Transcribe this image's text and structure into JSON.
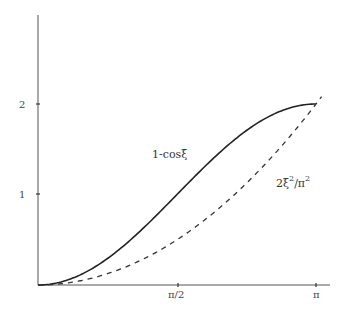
{
  "chart_data": {
    "type": "line",
    "title": "",
    "xlabel": "",
    "ylabel": "",
    "xlim": [
      0,
      3.14159
    ],
    "ylim": [
      0,
      2.3
    ],
    "grid": false,
    "legend": "none (inline curve labels)",
    "x_ticks": [
      {
        "value": 1.5708,
        "label": "π/2"
      },
      {
        "value": 3.14159,
        "label": "π"
      }
    ],
    "y_ticks": [
      {
        "value": 1,
        "label": "1"
      },
      {
        "value": 2,
        "label": "2"
      }
    ],
    "x": [
      0,
      0.3142,
      0.6283,
      0.9425,
      1.2566,
      1.5708,
      1.885,
      2.1991,
      2.5133,
      2.8274,
      3.1416
    ],
    "series": [
      {
        "name": "1-cosξ",
        "style": "solid",
        "values": [
          0,
          0.049,
          0.191,
          0.412,
          0.691,
          1.0,
          1.309,
          1.588,
          1.809,
          1.951,
          2.0
        ]
      },
      {
        "name": "2ξ²/π²",
        "style": "dashed",
        "values": [
          0,
          0.02,
          0.08,
          0.18,
          0.32,
          0.5,
          0.72,
          0.98,
          1.28,
          1.62,
          2.0
        ]
      }
    ],
    "annotations": [
      {
        "text": "1-cosξ",
        "near_x": 1.2,
        "near_y": 1.45
      },
      {
        "text": "2ξ²/π²",
        "near_x": 2.6,
        "near_y": 1.2
      }
    ]
  },
  "labels": {
    "curve1": "1-cosξ",
    "curve2_base": "2ξ",
    "curve2_sup1": "2",
    "curve2_mid": "/π",
    "curve2_sup2": "2",
    "ytick1": "1",
    "ytick2": "2",
    "xtick1": "π/2",
    "xtick2": "π"
  }
}
